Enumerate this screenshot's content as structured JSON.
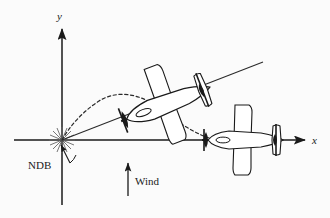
{
  "figure": {
    "background_color": "#fbfbfb",
    "ink_color": "#1a1a1a"
  },
  "axes": {
    "x_label": "x",
    "y_label": "y",
    "origin": {
      "x": 62,
      "y": 140
    },
    "x_axis": {
      "start_x": 14,
      "end_x": 308,
      "y": 140
    },
    "y_axis": {
      "x": 62,
      "start_y": 205,
      "end_y": 26
    }
  },
  "labels": {
    "ndb": "NDB",
    "wind": "Wind"
  },
  "beacon": {
    "name": "NDB",
    "x": 62,
    "y": 140,
    "rays": 16,
    "ray_length": 13
  },
  "wind_arrow": {
    "label": "Wind",
    "x": 128,
    "tail_y": 196,
    "head_y": 160,
    "direction": "up"
  },
  "straight_line": {
    "description": "Straight course line from NDB to upper right",
    "x1": 62,
    "y1": 140,
    "x2": 263,
    "y2": 62
  },
  "dashed_path": {
    "description": "Curved homing track drifting with the wind",
    "points": [
      [
        62,
        140
      ],
      [
        72,
        122
      ],
      [
        84,
        109
      ],
      [
        99,
        100
      ],
      [
        116,
        97
      ],
      [
        134,
        99
      ],
      [
        152,
        106
      ],
      [
        170,
        118
      ],
      [
        190,
        129
      ],
      [
        212,
        138
      ]
    ]
  },
  "aircraft": [
    {
      "id": "crabbed-aircraft",
      "position": {
        "x": 166,
        "y": 104
      },
      "rotation_deg": -21,
      "heading": "up-right, crabbed into wind"
    },
    {
      "id": "level-aircraft",
      "position": {
        "x": 243,
        "y": 140
      },
      "rotation_deg": 0,
      "heading": "along positive x-axis"
    }
  ]
}
